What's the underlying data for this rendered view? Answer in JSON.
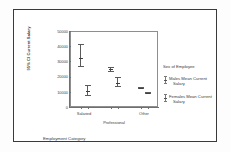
{
  "figure": {
    "frame_border_color": "#3a3a3a",
    "background": "#ffffff"
  },
  "chart_data": {
    "type": "scatter",
    "title": "",
    "subtitle": "",
    "xlabel": "Employment Category",
    "ylabel": "95% CI Current Salary",
    "categories": [
      "Salaried",
      "Professional",
      "Other"
    ],
    "ylim": [
      0,
      50000
    ],
    "yticks": [
      50000,
      40000,
      30000,
      20000,
      10000,
      0
    ],
    "ytick_labels": [
      "50000",
      "40000",
      "30000",
      "20000",
      "10000",
      "0"
    ],
    "grid": false,
    "legend_position": "right",
    "legend_title": "Sex of Employee",
    "error_bar_type": "95% confidence interval",
    "series": [
      {
        "name": "Males Mean Current Salary",
        "values": [
          32500,
          24700,
          12500
        ],
        "ci_low": [
          26000,
          23000,
          12000
        ],
        "ci_high": [
          41500,
          26500,
          13000
        ]
      },
      {
        "name": "Females Mean Current Salary",
        "values": [
          10800,
          15500,
          9300
        ],
        "ci_low": [
          7500,
          13000,
          8800
        ],
        "ci_high": [
          14500,
          19500,
          9900
        ]
      }
    ],
    "xtick_labels": [
      "Salaried",
      "",
      "Professional",
      "",
      "Other",
      ""
    ]
  },
  "axis": {
    "y_title": "95% CI Current Salary",
    "x_title": "Employment Category",
    "y_ticks": [
      {
        "label": "50000",
        "value": 50000
      },
      {
        "label": "40000",
        "value": 40000
      },
      {
        "label": "30000",
        "value": 30000
      },
      {
        "label": "20000",
        "value": 20000
      },
      {
        "label": "10000",
        "value": 10000
      },
      {
        "label": "0",
        "value": 0
      }
    ],
    "x_groups": [
      {
        "label": "Salaried",
        "row": 0
      },
      {
        "label": "Professional",
        "row": 1
      },
      {
        "label": "Other",
        "row": 0
      }
    ]
  },
  "legend": {
    "title": "Sex of Employee",
    "entries": [
      {
        "label_line1": "Males Mean Current",
        "label_line2": "Salary"
      },
      {
        "label_line1": "Females Mean Current",
        "label_line2": "Salary"
      }
    ]
  }
}
